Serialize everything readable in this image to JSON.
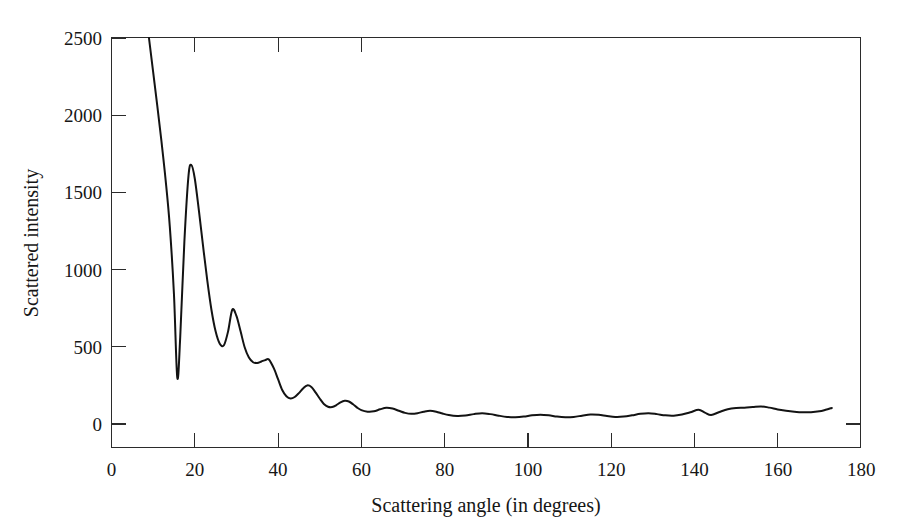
{
  "figure": {
    "background_color": "#ffffff",
    "line_color": "#131313",
    "axis_color": "#2b2b2b",
    "text_color": "#161616"
  },
  "chart_data": {
    "type": "line",
    "title": "",
    "subtitle": "",
    "xlabel": "Scattering angle (in degrees)",
    "ylabel": "Scattered intensity",
    "xlim": [
      0,
      180
    ],
    "ylim": [
      0,
      2500
    ],
    "xticks": [
      0,
      20,
      40,
      60,
      80,
      100,
      120,
      140,
      160,
      180
    ],
    "xtick_labels": [
      "0",
      "20",
      "40",
      "60",
      "80",
      "100",
      "120",
      "140",
      "160",
      "180"
    ],
    "yticks": [
      0,
      500,
      1000,
      1500,
      2000,
      2500
    ],
    "ytick_labels": [
      "0",
      "500",
      "1000",
      "1500",
      "2000",
      "2500"
    ],
    "grid": false,
    "legend": null,
    "legend_position": "none",
    "annotations": [],
    "series": [
      {
        "name": "Scattered intensity",
        "color": "#131313",
        "x": [
          9.0,
          10.0,
          11.0,
          12.0,
          13.0,
          14.0,
          15.0,
          15.8,
          16.5,
          17.5,
          18.5,
          19.2,
          20.0,
          21.0,
          22.0,
          23.0,
          24.0,
          25.0,
          26.0,
          27.0,
          28.0,
          29.0,
          30.0,
          31.0,
          32.0,
          33.0,
          34.0,
          35.0,
          36.0,
          37.0,
          37.8,
          39.0,
          40.0,
          41.0,
          42.0,
          43.0,
          44.0,
          45.0,
          46.0,
          47.0,
          48.0,
          49.0,
          50.0,
          51.0,
          52.0,
          53.0,
          54.0,
          55.0,
          56.0,
          57.0,
          58.0,
          59.0,
          60.0,
          61.5,
          63.0,
          64.5,
          66.0,
          67.5,
          69.0,
          70.5,
          72.0,
          73.5,
          75.0,
          76.5,
          78.0,
          79.5,
          81.0,
          83.0,
          85.0,
          87.0,
          89.0,
          91.0,
          93.0,
          95.0,
          97.0,
          99.0,
          101.0,
          103.0,
          105.0,
          107.0,
          109.0,
          111.0,
          113.0,
          115.0,
          117.0,
          119.0,
          121.0,
          123.0,
          125.0,
          127.0,
          129.0,
          131.0,
          133.0,
          135.0,
          137.0,
          139.0,
          141.0,
          142.5,
          144.0,
          146.0,
          148.0,
          150.0,
          152.0,
          154.0,
          156.0,
          158.0,
          160.0,
          162.0,
          164.0,
          166.0,
          168.0,
          170.0,
          171.5,
          173.0
        ],
        "y": [
          2500,
          2280,
          2060,
          1830,
          1580,
          1280,
          840,
          300,
          560,
          1180,
          1610,
          1677,
          1590,
          1380,
          1150,
          930,
          740,
          600,
          520,
          510,
          600,
          740,
          700,
          600,
          495,
          430,
          400,
          395,
          405,
          415,
          418,
          360,
          290,
          220,
          180,
          165,
          175,
          200,
          230,
          250,
          240,
          205,
          165,
          130,
          112,
          110,
          122,
          140,
          150,
          146,
          128,
          106,
          90,
          80,
          82,
          95,
          105,
          100,
          86,
          72,
          66,
          70,
          80,
          86,
          80,
          68,
          58,
          52,
          55,
          64,
          70,
          64,
          54,
          46,
          44,
          48,
          56,
          60,
          56,
          48,
          44,
          46,
          54,
          62,
          60,
          52,
          46,
          48,
          56,
          66,
          70,
          64,
          56,
          54,
          62,
          76,
          92,
          74,
          58,
          78,
          96,
          104,
          106,
          110,
          114,
          106,
          94,
          86,
          80,
          76,
          76,
          82,
          92,
          104
        ]
      }
    ]
  }
}
